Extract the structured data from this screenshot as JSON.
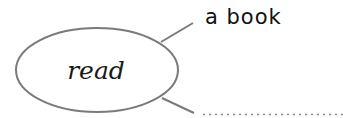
{
  "diagram": {
    "type": "word-web",
    "center": {
      "label": "read"
    },
    "branches": [
      {
        "label": "a book",
        "filled": true
      },
      {
        "label": "",
        "filled": false,
        "blank_style": "dotted-line"
      }
    ]
  },
  "colors": {
    "outline": "#7a7a7a",
    "text": "#111111",
    "dotted": "#8a8a8a"
  }
}
